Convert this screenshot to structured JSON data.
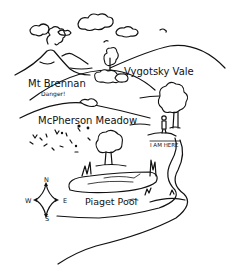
{
  "map": {
    "style": "hand-drawn black and white landscape map",
    "locations": [
      {
        "id": "mt-brennan",
        "name": "Mt Brennan",
        "note": "Danger!"
      },
      {
        "id": "vygotsky-vale",
        "name": "Vygotsky Vale"
      },
      {
        "id": "mcpherson-meadow",
        "name": "McPherson Meadow"
      },
      {
        "id": "piaget-pool",
        "name": "Piaget Pool"
      },
      {
        "id": "i-am-here",
        "name": "I AM HERE"
      }
    ],
    "compass": {
      "n": "N",
      "s": "S",
      "e": "E",
      "w": "W"
    },
    "colors": {
      "ink": "#111111",
      "paper": "#ffffff"
    }
  }
}
